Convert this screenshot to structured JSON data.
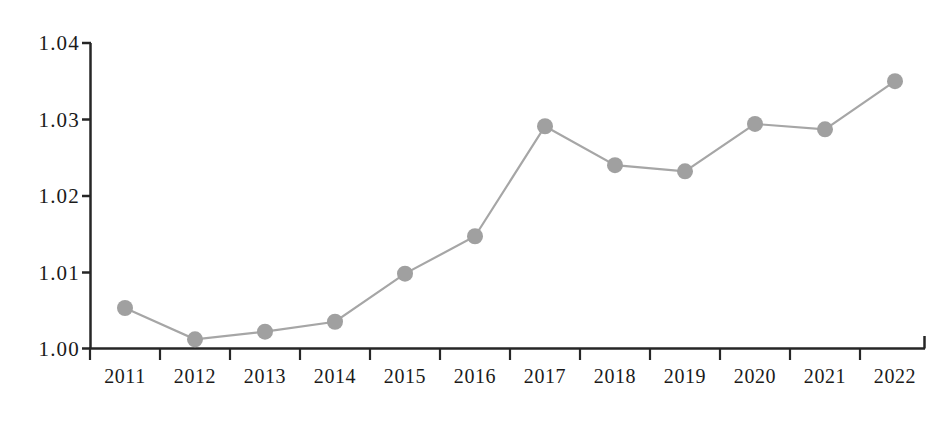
{
  "chart_data": {
    "type": "line",
    "title": "",
    "subtitle": "",
    "xlabel": "",
    "ylabel": "",
    "categories": [
      "2011",
      "2012",
      "2013",
      "2014",
      "2015",
      "2016",
      "2017",
      "2018",
      "2019",
      "2020",
      "2021",
      "2022"
    ],
    "values": [
      1.0053,
      1.0012,
      1.0022,
      1.0035,
      1.0098,
      1.0147,
      1.0291,
      1.024,
      1.0232,
      1.0294,
      1.0287,
      1.035
    ],
    "series": [
      {
        "name": "",
        "values": [
          1.0053,
          1.0012,
          1.0022,
          1.0035,
          1.0098,
          1.0147,
          1.0291,
          1.024,
          1.0232,
          1.0294,
          1.0287,
          1.035
        ]
      }
    ],
    "ylim": [
      1.0,
      1.04
    ],
    "ytick_labels": [
      "1.00",
      "1.01",
      "1.02",
      "1.03",
      "1.04"
    ],
    "ytick_values": [
      1.0,
      1.01,
      1.02,
      1.03,
      1.04
    ],
    "xtick_labels": [
      "2011",
      "2012",
      "2013",
      "2014",
      "2015",
      "2016",
      "2017",
      "2018",
      "2019",
      "2020",
      "2021",
      "2022"
    ],
    "grid": false,
    "legend": false,
    "legend_position": "none",
    "annotations": [],
    "colors": {
      "line": "#a6a6a6",
      "marker": "#a0a0a0",
      "axis": "#262626",
      "text": "#1a1a1a",
      "background": "#ffffff"
    },
    "marker_shape": "circle"
  },
  "axis": {
    "y_labels": [
      {
        "text": "1.04",
        "value": 1.04
      },
      {
        "text": "1.03",
        "value": 1.03
      },
      {
        "text": "1.02",
        "value": 1.02
      },
      {
        "text": "1.01",
        "value": 1.01
      },
      {
        "text": "1.00",
        "value": 1.0
      }
    ],
    "x_labels": [
      {
        "text": "2011"
      },
      {
        "text": "2012"
      },
      {
        "text": "2013"
      },
      {
        "text": "2014"
      },
      {
        "text": "2015"
      },
      {
        "text": "2016"
      },
      {
        "text": "2017"
      },
      {
        "text": "2018"
      },
      {
        "text": "2019"
      },
      {
        "text": "2020"
      },
      {
        "text": "2021"
      },
      {
        "text": "2022"
      }
    ]
  }
}
